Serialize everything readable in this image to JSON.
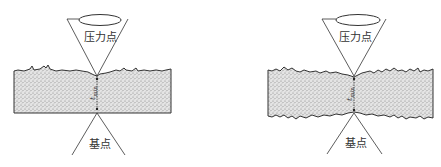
{
  "diagram": {
    "type": "thickness-measurement-schematic",
    "colors": {
      "line": "#333333",
      "fill": "#d9d9d9",
      "stipple": "#8a8a8a",
      "background": "#ffffff"
    },
    "panels": [
      {
        "id": "left",
        "description": "sample with rough top surface, flat bottom",
        "pressure_point_label": "压力点",
        "base_point_label": "基点",
        "thickness_symbol": "t",
        "thickness_subscript": "min"
      },
      {
        "id": "right",
        "description": "sample with rough top and bottom surfaces",
        "pressure_point_label": "压力点",
        "base_point_label": "基点",
        "thickness_symbol": "t",
        "thickness_subscript": "min"
      }
    ]
  }
}
